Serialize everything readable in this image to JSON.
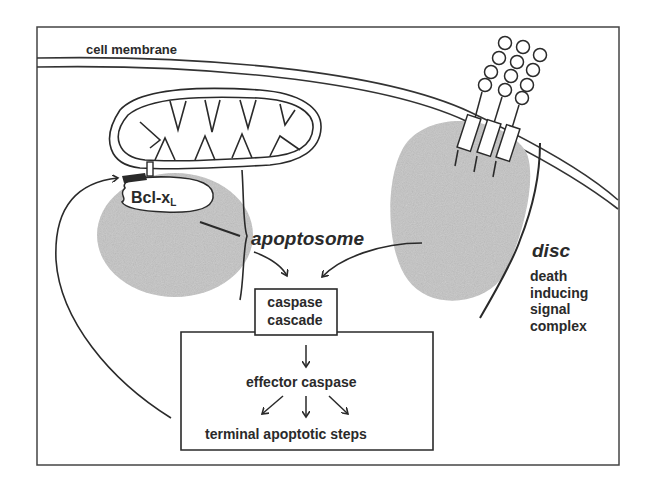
{
  "figure": {
    "labels": {
      "cell_membrane": "cell membrane",
      "bcl_xl_main": "Bcl-x",
      "bcl_xl_sub": "L",
      "apoptosome": "apoptosome",
      "disc": "disc",
      "disc_description": "death inducing signal complex",
      "caspase_cascade": "caspase cascade",
      "effector_caspase": "effector caspase",
      "terminal_steps": "terminal apoptotic steps"
    },
    "colors": {
      "ink": "#2a2a2a",
      "shading": "#bdbdbd",
      "background": "#ffffff"
    }
  }
}
